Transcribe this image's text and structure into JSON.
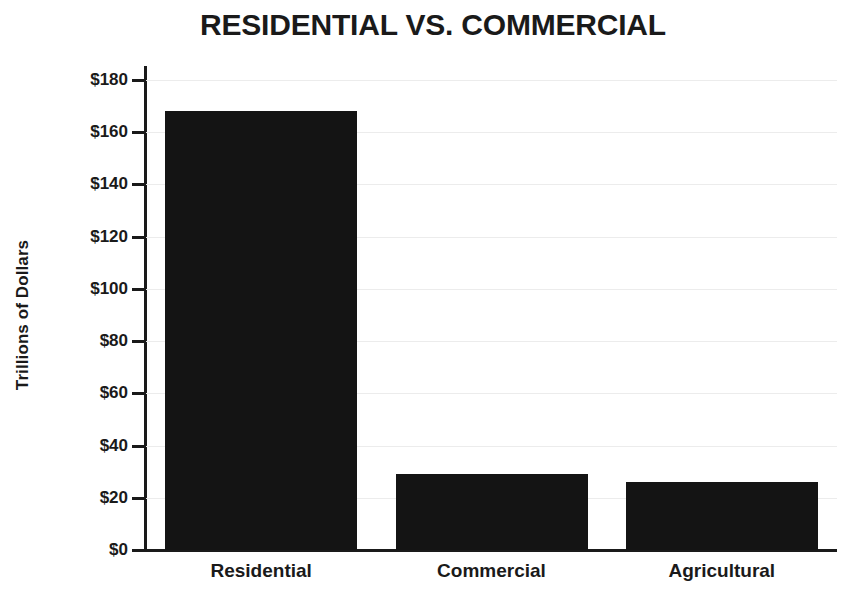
{
  "chart_data": {
    "type": "bar",
    "title": "RESIDENTIAL VS. COMMERCIAL",
    "xlabel": "",
    "ylabel": "Trillions of Dollars",
    "categories": [
      "Residential",
      "Commercial",
      "Agricultural"
    ],
    "values": [
      168,
      29,
      26
    ],
    "ylim": [
      0,
      180
    ],
    "ytick_values": [
      0,
      20,
      40,
      60,
      80,
      100,
      120,
      140,
      160,
      180
    ],
    "ytick_labels": [
      "$0",
      "$20",
      "$40",
      "$60",
      "$80",
      "$100",
      "$120",
      "$140",
      "$160",
      "$180"
    ],
    "grid": true,
    "legend": false,
    "legend_position": "none",
    "series": [
      {
        "name": "Value",
        "values": [
          168,
          29,
          26
        ]
      }
    ],
    "colors": {
      "bar": "#141414",
      "axis": "#1a1a1a",
      "grid": "#ececec",
      "text": "#1a1a1a",
      "background": "#ffffff"
    }
  }
}
